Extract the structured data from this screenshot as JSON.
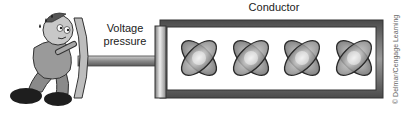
{
  "diagram": {
    "title": "Conductor",
    "pressure_label_line1": "Voltage",
    "pressure_label_line2": "pressure",
    "copyright": "© Delmar/Cengage Learning",
    "elements": {
      "figure": "cartoon man pushing against a plate",
      "rod": "piston rod",
      "plate": "piston plate",
      "conductor": "rectangular conductor tube",
      "atoms": [
        "atom-1",
        "atom-2",
        "atom-3",
        "atom-4"
      ]
    },
    "colors": {
      "outline": "#333333",
      "frame": "#6a6a6a",
      "atom_fill": "#9a9a9a",
      "atom_highlight": "#e8e8e8",
      "rod": "#8a8a8a"
    }
  }
}
